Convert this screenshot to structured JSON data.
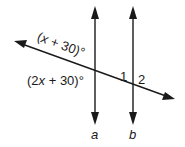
{
  "diagram": {
    "type": "parallel-lines-transversal",
    "lines": [
      {
        "id": "a",
        "label": "a",
        "x": 95
      },
      {
        "id": "b",
        "label": "b",
        "x": 133
      }
    ],
    "angles": {
      "upper_left_at_a": {
        "label_pre": "(",
        "var": "x",
        "label_post": " + 30)°"
      },
      "lower_left_at_a": {
        "label_pre": "(2",
        "var": "x",
        "label_post": " + 30)°"
      },
      "angle_1": "1",
      "angle_2": "2"
    },
    "colors": {
      "stroke": "#1a1a1a",
      "background": "#ffffff"
    }
  }
}
